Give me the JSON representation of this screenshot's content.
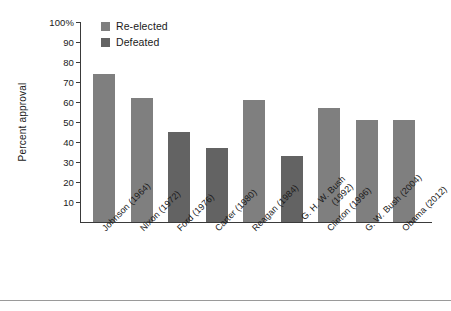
{
  "chart": {
    "type": "bar",
    "ylabel": "Percent approval",
    "legend": [
      {
        "label": "Re-elected",
        "color": "#7f7f7f",
        "swatch_name": "legend-swatch-re-elected"
      },
      {
        "label": "Defeated",
        "color": "#636363",
        "swatch_name": "legend-swatch-defeated"
      }
    ],
    "y_ticks": [
      "100%",
      "90",
      "80",
      "70",
      "60",
      "50",
      "40",
      "30",
      "20",
      "10"
    ]
  },
  "chart_data": {
    "type": "bar",
    "title": "",
    "xlabel": "",
    "ylabel": "Percent approval",
    "ylim": [
      0,
      100
    ],
    "grid": false,
    "legend_position": "top-left",
    "categories": [
      "Johnson (1964)",
      "Nixon (1972)",
      "Ford (1976)",
      "Carter (1980)",
      "Reagan (1984)",
      "G. H. W. Bush (1992)",
      "Clinton (1996)",
      "G. W. Bush (2004)",
      "Obama (2012)"
    ],
    "values": [
      74,
      62,
      45,
      37,
      61,
      33,
      57,
      51,
      51
    ],
    "groups": [
      "Re-elected",
      "Re-elected",
      "Defeated",
      "Defeated",
      "Re-elected",
      "Defeated",
      "Re-elected",
      "Re-elected",
      "Re-elected"
    ],
    "series": [
      {
        "name": "Re-elected",
        "color": "#7f7f7f",
        "points": [
          {
            "category": "Johnson (1964)",
            "value": 74
          },
          {
            "category": "Nixon (1972)",
            "value": 62
          },
          {
            "category": "Reagan (1984)",
            "value": 61
          },
          {
            "category": "Clinton (1996)",
            "value": 57
          },
          {
            "category": "G. W. Bush (2004)",
            "value": 51
          },
          {
            "category": "Obama (2012)",
            "value": 51
          }
        ]
      },
      {
        "name": "Defeated",
        "color": "#636363",
        "points": [
          {
            "category": "Ford (1976)",
            "value": 45
          },
          {
            "category": "Carter (1980)",
            "value": 37
          },
          {
            "category": "G. H. W. Bush (1992)",
            "value": 33
          }
        ]
      }
    ],
    "y_tick_values": [
      100,
      90,
      80,
      70,
      60,
      50,
      40,
      30,
      20,
      10
    ],
    "y_tick_labels": [
      "100%",
      "90",
      "80",
      "70",
      "60",
      "50",
      "40",
      "30",
      "20",
      "10"
    ]
  }
}
